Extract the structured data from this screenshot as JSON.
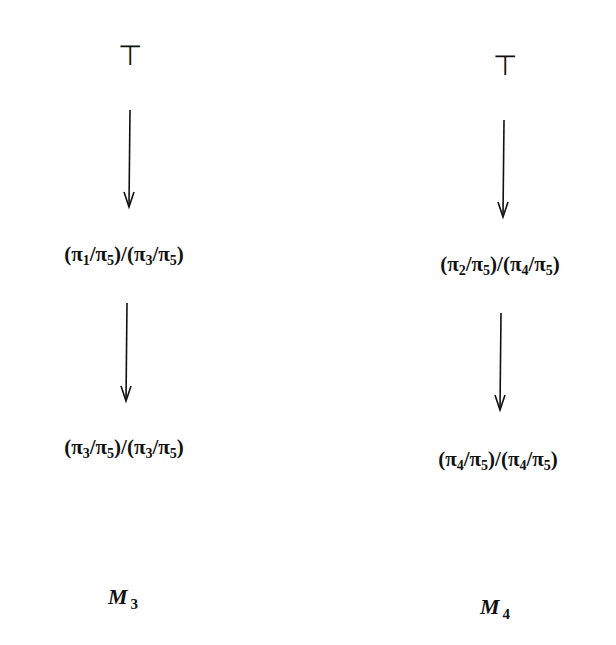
{
  "diagram": {
    "columns": [
      {
        "id": "M3",
        "top_symbol": "⊤",
        "nodes": [
          {
            "parts": [
              [
                "(π",
                "1"
              ],
              [
                "/π",
                "5"
              ],
              [
                ")/(π",
                "3"
              ],
              [
                "/π",
                "5"
              ],
              [
                ")",
                ""
              ]
            ]
          },
          {
            "parts": [
              [
                "(π",
                "3"
              ],
              [
                "/π",
                "5"
              ],
              [
                ")/(π",
                "3"
              ],
              [
                "/π",
                "5"
              ],
              [
                ")",
                ""
              ]
            ]
          }
        ],
        "node_text": [
          "(π1/π5)/(π3/π5)",
          "(π3/π5)/(π3/π5)"
        ],
        "label": {
          "base": "M",
          "sub": "3"
        }
      },
      {
        "id": "M4",
        "top_symbol": "⊤",
        "nodes": [
          {
            "parts": [
              [
                "(π",
                "2"
              ],
              [
                "/π",
                "5"
              ],
              [
                ")/(π",
                "4"
              ],
              [
                "/π",
                "5"
              ],
              [
                ")",
                ""
              ]
            ]
          },
          {
            "parts": [
              [
                "(π",
                "4"
              ],
              [
                "/π",
                "5"
              ],
              [
                ")/(π",
                "4"
              ],
              [
                "/π",
                "5"
              ],
              [
                ")",
                ""
              ]
            ]
          }
        ],
        "node_text": [
          "(π2/π5)/(π4/π5)",
          "(π4/π5)/(π4/π5)"
        ],
        "label": {
          "base": "M",
          "sub": "4"
        }
      }
    ],
    "colors": {
      "ink": "#111111",
      "background": "#ffffff"
    }
  }
}
